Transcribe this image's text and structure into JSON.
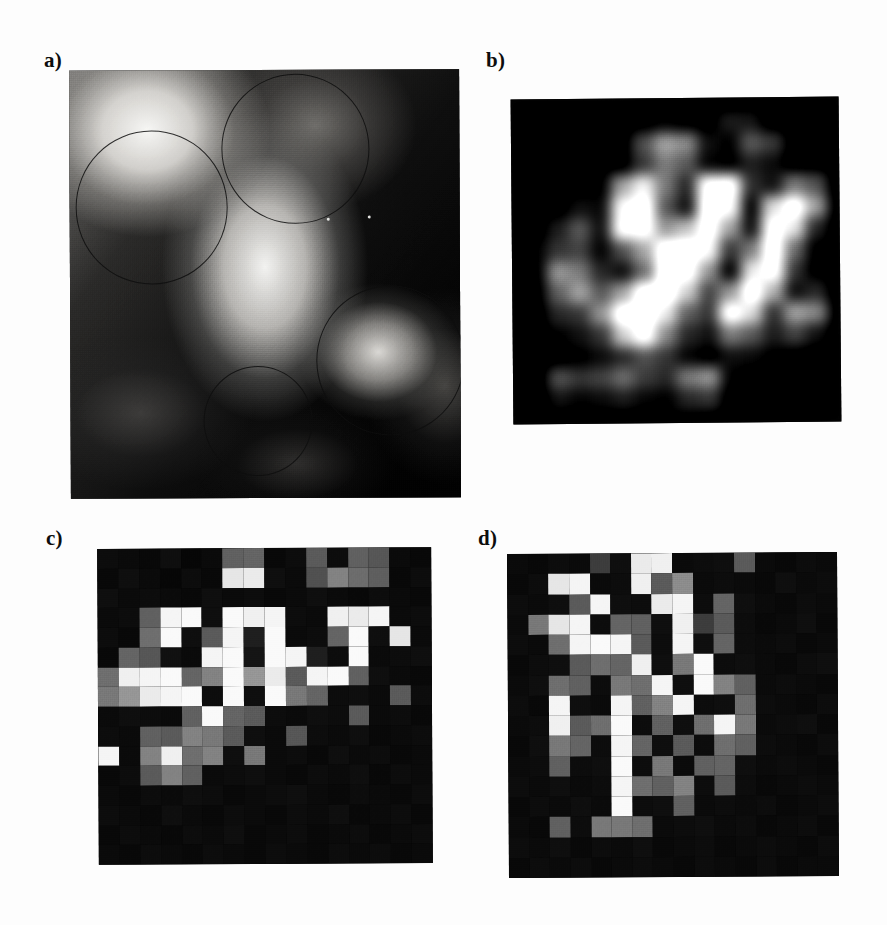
{
  "figure": {
    "background_color": "#ffffff",
    "ink_color": "#0d0d0d",
    "panel_count": 4
  },
  "labels": {
    "a": "a)",
    "b": "b)",
    "c": "c)",
    "d": "d)"
  },
  "panel_a": {
    "label": "a)",
    "kind": "continuous-grayscale-image",
    "roi_circles": [
      {
        "name": "roi-top-right",
        "cx_pct": 58.0,
        "cy_pct": 18.5,
        "r_pct": 19.0
      },
      {
        "name": "roi-upper-left",
        "cx_pct": 21.0,
        "cy_pct": 32.0,
        "r_pct": 19.5
      },
      {
        "name": "roi-lower-right",
        "cx_pct": 82.0,
        "cy_pct": 68.0,
        "r_pct": 19.0
      },
      {
        "name": "roi-bottom-mid",
        "cx_pct": 48.0,
        "cy_pct": 82.0,
        "r_pct": 14.0
      }
    ],
    "speckle_dots": [
      {
        "x_pct": 66.0,
        "y_pct": 34.5
      },
      {
        "x_pct": 76.5,
        "y_pct": 34.0
      }
    ]
  },
  "chart_data": [
    {
      "type": "heatmap",
      "panel": "b",
      "title": "b)",
      "rendering": "smoothed",
      "colormap": "grayscale",
      "vmin": 0,
      "vmax": 255,
      "rows": 16,
      "cols": 16,
      "values": [
        [
          10,
          12,
          8,
          14,
          10,
          9,
          12,
          10,
          18,
          14,
          10,
          12,
          9,
          10,
          12,
          8
        ],
        [
          12,
          10,
          14,
          10,
          16,
          12,
          20,
          30,
          22,
          18,
          52,
          48,
          14,
          12,
          10,
          12
        ],
        [
          8,
          14,
          10,
          12,
          18,
          14,
          88,
          150,
          132,
          44,
          30,
          96,
          74,
          18,
          12,
          10
        ],
        [
          14,
          10,
          16,
          22,
          20,
          18,
          70,
          120,
          96,
          34,
          26,
          54,
          40,
          14,
          16,
          12
        ],
        [
          10,
          18,
          14,
          20,
          26,
          150,
          210,
          120,
          60,
          235,
          240,
          66,
          44,
          120,
          92,
          14
        ],
        [
          12,
          14,
          20,
          44,
          38,
          220,
          245,
          96,
          44,
          250,
          225,
          30,
          190,
          245,
          150,
          18
        ],
        [
          10,
          16,
          52,
          96,
          44,
          230,
          235,
          140,
          170,
          240,
          150,
          40,
          235,
          200,
          60,
          14
        ],
        [
          14,
          30,
          70,
          80,
          34,
          90,
          150,
          245,
          250,
          220,
          72,
          120,
          245,
          110,
          26,
          16
        ],
        [
          12,
          24,
          140,
          120,
          60,
          40,
          110,
          250,
          235,
          140,
          30,
          200,
          235,
          70,
          22,
          12
        ],
        [
          10,
          20,
          100,
          150,
          96,
          150,
          245,
          250,
          180,
          80,
          140,
          245,
          160,
          40,
          60,
          14
        ],
        [
          14,
          16,
          60,
          70,
          140,
          245,
          250,
          200,
          100,
          70,
          235,
          190,
          66,
          150,
          130,
          16
        ],
        [
          10,
          14,
          30,
          44,
          70,
          180,
          235,
          130,
          60,
          44,
          120,
          96,
          52,
          80,
          44,
          12
        ],
        [
          12,
          10,
          18,
          26,
          40,
          60,
          90,
          70,
          34,
          20,
          44,
          40,
          26,
          20,
          16,
          10
        ],
        [
          8,
          12,
          90,
          70,
          80,
          110,
          74,
          60,
          120,
          140,
          30,
          18,
          12,
          14,
          10,
          12
        ],
        [
          10,
          14,
          44,
          34,
          40,
          52,
          36,
          30,
          60,
          70,
          18,
          14,
          10,
          12,
          14,
          8
        ],
        [
          12,
          10,
          12,
          8,
          14,
          10,
          12,
          26,
          20,
          14,
          12,
          10,
          12,
          8,
          10,
          12
        ]
      ]
    },
    {
      "type": "heatmap",
      "panel": "c",
      "title": "c)",
      "rendering": "pixelated",
      "colormap": "grayscale",
      "vmin": 0,
      "vmax": 255,
      "rows": 16,
      "cols": 16,
      "values": [
        [
          12,
          10,
          8,
          14,
          6,
          10,
          96,
          100,
          8,
          12,
          90,
          12,
          96,
          86,
          10,
          8
        ],
        [
          8,
          14,
          10,
          6,
          12,
          8,
          230,
          235,
          14,
          10,
          80,
          130,
          108,
          94,
          8,
          12
        ],
        [
          14,
          10,
          12,
          10,
          8,
          14,
          10,
          12,
          8,
          10,
          14,
          10,
          8,
          12,
          10,
          8
        ],
        [
          10,
          12,
          96,
          245,
          250,
          14,
          250,
          240,
          245,
          12,
          10,
          240,
          235,
          245,
          10,
          12
        ],
        [
          12,
          8,
          110,
          250,
          14,
          90,
          245,
          30,
          250,
          10,
          12,
          100,
          250,
          14,
          230,
          10
        ],
        [
          8,
          100,
          86,
          16,
          10,
          245,
          250,
          20,
          250,
          245,
          30,
          12,
          250,
          10,
          12,
          14
        ],
        [
          110,
          240,
          245,
          250,
          100,
          130,
          250,
          150,
          235,
          90,
          245,
          250,
          96,
          14,
          10,
          8
        ],
        [
          120,
          150,
          235,
          245,
          250,
          12,
          250,
          14,
          250,
          120,
          100,
          12,
          14,
          10,
          90,
          12
        ],
        [
          10,
          14,
          12,
          10,
          96,
          250,
          100,
          90,
          12,
          10,
          14,
          12,
          90,
          10,
          12,
          8
        ],
        [
          12,
          10,
          96,
          90,
          130,
          120,
          90,
          14,
          10,
          86,
          12,
          10,
          14,
          8,
          10,
          12
        ],
        [
          245,
          10,
          130,
          240,
          110,
          130,
          14,
          120,
          10,
          12,
          8,
          14,
          10,
          12,
          8,
          10
        ],
        [
          8,
          12,
          90,
          130,
          96,
          10,
          12,
          14,
          10,
          8,
          12,
          10,
          14,
          8,
          12,
          10
        ],
        [
          10,
          8,
          12,
          10,
          14,
          12,
          8,
          10,
          12,
          14,
          10,
          8,
          12,
          10,
          8,
          12
        ],
        [
          12,
          10,
          8,
          14,
          10,
          8,
          12,
          10,
          8,
          12,
          10,
          14,
          8,
          10,
          12,
          8
        ],
        [
          8,
          12,
          10,
          8,
          12,
          10,
          14,
          8,
          10,
          12,
          8,
          10,
          12,
          8,
          10,
          12
        ],
        [
          10,
          8,
          12,
          10,
          8,
          12,
          10,
          8,
          12,
          10,
          8,
          12,
          10,
          12,
          8,
          10
        ]
      ]
    },
    {
      "type": "heatmap",
      "panel": "d",
      "title": "d)",
      "rendering": "pixelated",
      "colormap": "grayscale",
      "vmin": 0,
      "vmax": 255,
      "rows": 16,
      "cols": 16,
      "values": [
        [
          10,
          8,
          12,
          10,
          60,
          14,
          235,
          240,
          10,
          12,
          14,
          90,
          10,
          8,
          12,
          10
        ],
        [
          8,
          12,
          230,
          245,
          10,
          12,
          240,
          90,
          140,
          10,
          12,
          10,
          8,
          14,
          10,
          12
        ],
        [
          12,
          10,
          14,
          90,
          245,
          14,
          12,
          235,
          245,
          12,
          100,
          14,
          10,
          8,
          12,
          10
        ],
        [
          10,
          120,
          230,
          245,
          12,
          100,
          96,
          14,
          240,
          60,
          90,
          12,
          8,
          10,
          14,
          8
        ],
        [
          12,
          10,
          110,
          245,
          250,
          245,
          90,
          12,
          245,
          14,
          100,
          12,
          10,
          12,
          8,
          10
        ],
        [
          8,
          12,
          14,
          90,
          110,
          100,
          240,
          14,
          120,
          250,
          12,
          14,
          10,
          8,
          12,
          14
        ],
        [
          10,
          14,
          110,
          96,
          12,
          120,
          110,
          245,
          14,
          250,
          130,
          96,
          10,
          12,
          10,
          8
        ],
        [
          12,
          8,
          245,
          14,
          10,
          245,
          96,
          130,
          245,
          12,
          14,
          110,
          12,
          10,
          8,
          12
        ],
        [
          10,
          12,
          240,
          90,
          110,
          250,
          12,
          96,
          14,
          110,
          245,
          120,
          10,
          12,
          14,
          8
        ],
        [
          8,
          14,
          120,
          100,
          12,
          245,
          100,
          14,
          90,
          12,
          110,
          96,
          12,
          10,
          8,
          12
        ],
        [
          10,
          12,
          96,
          12,
          14,
          250,
          12,
          120,
          10,
          96,
          100,
          14,
          10,
          12,
          10,
          8
        ],
        [
          12,
          10,
          14,
          10,
          12,
          245,
          110,
          96,
          130,
          12,
          90,
          12,
          8,
          10,
          12,
          10
        ],
        [
          8,
          12,
          10,
          14,
          10,
          250,
          12,
          14,
          96,
          10,
          12,
          10,
          12,
          8,
          10,
          12
        ],
        [
          10,
          8,
          96,
          12,
          120,
          120,
          110,
          10,
          12,
          14,
          10,
          12,
          8,
          10,
          12,
          8
        ],
        [
          12,
          10,
          14,
          8,
          12,
          10,
          14,
          8,
          10,
          12,
          8,
          10,
          12,
          10,
          8,
          12
        ],
        [
          8,
          12,
          10,
          12,
          8,
          10,
          12,
          10,
          8,
          12,
          10,
          8,
          12,
          8,
          10,
          10
        ]
      ]
    }
  ]
}
